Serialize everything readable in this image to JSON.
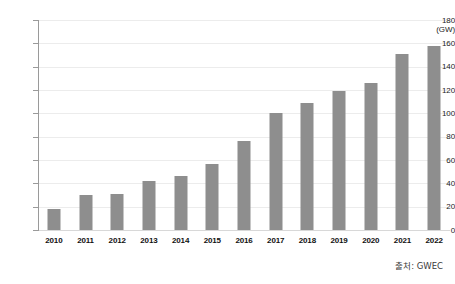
{
  "chart_data": {
    "type": "bar",
    "title": "",
    "subtitle": "",
    "xlabel": "",
    "ylabel": "",
    "unit_label": "(GW)",
    "categories": [
      "2010",
      "2011",
      "2012",
      "2013",
      "2014",
      "2015",
      "2016",
      "2017",
      "2018",
      "2019",
      "2020",
      "2021",
      "2022"
    ],
    "values": [
      18,
      30,
      31,
      42,
      46,
      57,
      76,
      100,
      109,
      119,
      126,
      151,
      158
    ],
    "series": [
      {
        "name": "Global cumulative wind power capacity",
        "values": [
          18,
          30,
          31,
          42,
          46,
          57,
          76,
          100,
          109,
          119,
          126,
          151,
          158
        ]
      }
    ],
    "ylim": [
      0,
      180
    ],
    "ytick_step": 20,
    "yticks": [
      "180",
      "160",
      "140",
      "120",
      "100",
      "80",
      "60",
      "40",
      "20",
      "0"
    ],
    "grid": true,
    "legend": false,
    "legend_position": "none",
    "bar_color": "#8e8e8e",
    "gridline_color": "#ececec",
    "axis_color": "#9a9a9a",
    "annotations": [
      "출처: GWEC"
    ]
  },
  "footer": {
    "source": "출처: GWEC"
  }
}
